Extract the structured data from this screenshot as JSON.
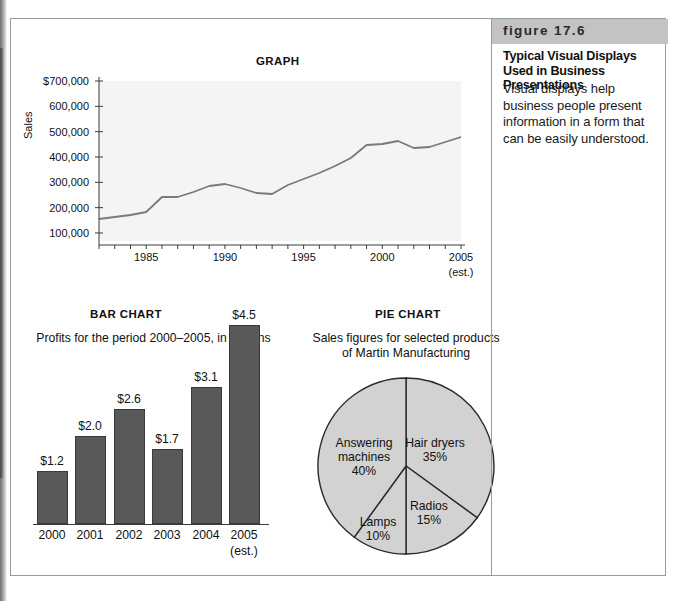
{
  "figure": {
    "tag": "figure 17.6",
    "title": "Typical Visual Displays Used in Business Presentations",
    "body": "Visual displays help business people present information in a form that can be easily understood."
  },
  "line_chart": {
    "title": "GRAPH",
    "ylabel": "Sales",
    "ytick_labels": [
      "$700,000",
      "600,000",
      "500,000",
      "400,000",
      "300,000",
      "200,000",
      "100,000"
    ],
    "xtick_labels": [
      "1985",
      "1990",
      "1995",
      "2000",
      "2005"
    ],
    "xtick_sub": "(est.)"
  },
  "bar_chart": {
    "title": "BAR CHART",
    "subtitle": "Profits for the period 2000–2005, in millions",
    "cat_sub": "(est.)"
  },
  "pie_chart": {
    "title": "PIE CHART",
    "subtitle": "Sales figures for selected products of Martin Manufacturing"
  },
  "colors": {
    "plot_bg": "#f4f4f4",
    "line": "#7a7a7a",
    "bar_fill": "#595959",
    "pie_fill": "#d2d2d2",
    "pie_stroke": "#2b2b2b",
    "tag_bar": "#c3c3c3",
    "frame_border": "#9a9a9a"
  },
  "chart_data": [
    {
      "type": "line",
      "title": "GRAPH",
      "xlabel": "",
      "ylabel": "Sales",
      "xlim": [
        1982,
        2005
      ],
      "ylim": [
        0,
        700000
      ],
      "grid": false,
      "legend": "none",
      "ytick_values": [
        100000,
        200000,
        300000,
        400000,
        500000,
        600000,
        700000
      ],
      "ytick_labels": [
        "100,000",
        "200,000",
        "300,000",
        "400,000",
        "500,000",
        "600,000",
        "$700,000"
      ],
      "xtick_values": [
        1985,
        1990,
        1995,
        2000,
        2005
      ],
      "xtick_labels": [
        "1985",
        "1990",
        "1995",
        "2000",
        "2005"
      ],
      "annotations": [
        "(est.) under 2005"
      ],
      "x": [
        1982,
        1983,
        1984,
        1985,
        1986,
        1987,
        1988,
        1989,
        1990,
        1991,
        1992,
        1993,
        1994,
        1995,
        1996,
        1997,
        1998,
        1999,
        2000,
        2001,
        2002,
        2003,
        2004,
        2005
      ],
      "values": [
        95000,
        103000,
        110000,
        120000,
        192000,
        195000,
        212000,
        235000,
        243000,
        228000,
        212000,
        207000,
        245000,
        272000,
        298000,
        325000,
        360000,
        418000,
        425000,
        437000,
        408000,
        412000,
        432000,
        455000
      ]
    },
    {
      "type": "bar",
      "title": "BAR CHART",
      "subtitle": "Profits for the period 2000–2005, in millions",
      "xlabel": "",
      "ylabel": "",
      "ylim": [
        0,
        4.5
      ],
      "grid": false,
      "legend": "none",
      "categories": [
        "2000",
        "2001",
        "2002",
        "2003",
        "2004",
        "2005"
      ],
      "values": [
        1.2,
        2.0,
        2.6,
        1.7,
        3.1,
        4.5
      ],
      "data_labels": [
        "$1.2",
        "$2.0",
        "$2.6",
        "$1.7",
        "$3.1",
        "$4.5"
      ]
    },
    {
      "type": "pie",
      "title": "PIE CHART",
      "subtitle": "Sales figures for selected products of Martin Manufacturing",
      "legend": "none",
      "labels": [
        "Hair dryers",
        "Radios",
        "Lamps",
        "Answering machines"
      ],
      "values": [
        35,
        15,
        10,
        40
      ],
      "data_labels": [
        "35%",
        "15%",
        "10%",
        "40%"
      ]
    }
  ],
  "line_points_px": [
    {
      "x": 0,
      "y": 138
    },
    {
      "x": 15.7,
      "y": 136
    },
    {
      "x": 31.5,
      "y": 134
    },
    {
      "x": 47.2,
      "y": 131
    },
    {
      "x": 63,
      "y": 116
    },
    {
      "x": 78.7,
      "y": 116
    },
    {
      "x": 94.4,
      "y": 111
    },
    {
      "x": 110.2,
      "y": 105
    },
    {
      "x": 125.9,
      "y": 103
    },
    {
      "x": 141.7,
      "y": 107
    },
    {
      "x": 157.4,
      "y": 112
    },
    {
      "x": 173.1,
      "y": 113
    },
    {
      "x": 188.9,
      "y": 104
    },
    {
      "x": 204.6,
      "y": 98
    },
    {
      "x": 220.3,
      "y": 92
    },
    {
      "x": 236.1,
      "y": 85
    },
    {
      "x": 251.8,
      "y": 77
    },
    {
      "x": 267.6,
      "y": 64
    },
    {
      "x": 283.3,
      "y": 63
    },
    {
      "x": 299,
      "y": 60
    },
    {
      "x": 314.8,
      "y": 67
    },
    {
      "x": 330.5,
      "y": 66
    },
    {
      "x": 346.3,
      "y": 61
    },
    {
      "x": 362,
      "y": 56
    }
  ],
  "bars_px": [
    {
      "label": "2000",
      "value_label": "$1.2",
      "cx": 41,
      "w": 31,
      "h": 53,
      "top": 452
    },
    {
      "label": "2001",
      "value_label": "$2.0",
      "cx": 79,
      "w": 31,
      "h": 88,
      "top": 417
    },
    {
      "label": "2002",
      "value_label": "$2.6",
      "cx": 118,
      "w": 31,
      "h": 115,
      "top": 390
    },
    {
      "label": "2003",
      "value_label": "$1.7",
      "cx": 156,
      "w": 31,
      "h": 75,
      "top": 430
    },
    {
      "label": "2004",
      "value_label": "$3.1",
      "cx": 195,
      "w": 31,
      "h": 137,
      "top": 368
    },
    {
      "label": "2005",
      "value_label": "$4.5",
      "cx": 233,
      "w": 31,
      "h": 199,
      "top": 306
    }
  ],
  "pie_labels_px": [
    {
      "name": "Hair dryers",
      "pct": "35%",
      "x": 124,
      "y": 76
    },
    {
      "name": "Radios",
      "pct": "15%",
      "x": 118,
      "y": 139
    },
    {
      "name": "Lamps",
      "pct": "10%",
      "x": 67,
      "y": 155
    },
    {
      "name": "Answering machines",
      "pct": "40%",
      "x": 53,
      "y": 83
    }
  ]
}
